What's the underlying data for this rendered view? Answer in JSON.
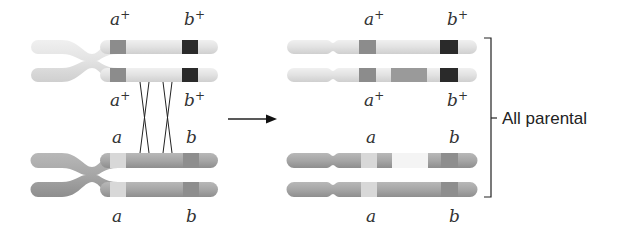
{
  "figure": {
    "left_panel": {
      "label": "Before crossing over (two homologs, four chromatids)",
      "top_homolog": {
        "labels_above": [
          {
            "gene": "a",
            "sup": "+"
          },
          {
            "gene": "b",
            "sup": "+"
          }
        ],
        "labels_below": [
          {
            "gene": "a",
            "sup": "+"
          },
          {
            "gene": "b",
            "sup": "+"
          }
        ],
        "color": "#e4e4e4"
      },
      "bottom_homolog": {
        "labels_above": [
          {
            "gene": "a",
            "sup": ""
          },
          {
            "gene": "b",
            "sup": ""
          }
        ],
        "labels_below": [
          {
            "gene": "a",
            "sup": ""
          },
          {
            "gene": "b",
            "sup": ""
          }
        ],
        "color": "#a4a4a4"
      },
      "crossovers": 2
    },
    "arrow": "right-arrow",
    "right_panel": {
      "chromatids": [
        {
          "row": 1,
          "alleles": [
            "a+",
            "b+"
          ],
          "exchanged_segment": false
        },
        {
          "row": 2,
          "alleles": [
            "a+",
            "b+"
          ],
          "exchanged_segment": true
        },
        {
          "row": 3,
          "alleles": [
            "a",
            "b"
          ],
          "exchanged_segment": true
        },
        {
          "row": 4,
          "alleles": [
            "a",
            "b"
          ],
          "exchanged_segment": false
        }
      ],
      "labels": {
        "top_above": [
          {
            "gene": "a",
            "sup": "+"
          },
          {
            "gene": "b",
            "sup": "+"
          }
        ],
        "top_below": [
          {
            "gene": "a",
            "sup": "+"
          },
          {
            "gene": "b",
            "sup": "+"
          }
        ],
        "bottom_above": [
          {
            "gene": "a",
            "sup": ""
          },
          {
            "gene": "b",
            "sup": ""
          }
        ],
        "bottom_below": [
          {
            "gene": "a",
            "sup": ""
          },
          {
            "gene": "b",
            "sup": ""
          }
        ]
      }
    },
    "bracket_label": "All parental",
    "colors": {
      "light_chromosome": "#e4e4e4",
      "dark_chromosome": "#a4a4a4",
      "a_plus_band": "#8c8c8c",
      "b_plus_band": "#2a2a2a",
      "a_band": "#d8d8d8",
      "b_band": "#8e8e8e",
      "exchanged_dark": "#9a9a9a",
      "exchanged_light": "#f4f4f4",
      "line": "#222222"
    }
  }
}
